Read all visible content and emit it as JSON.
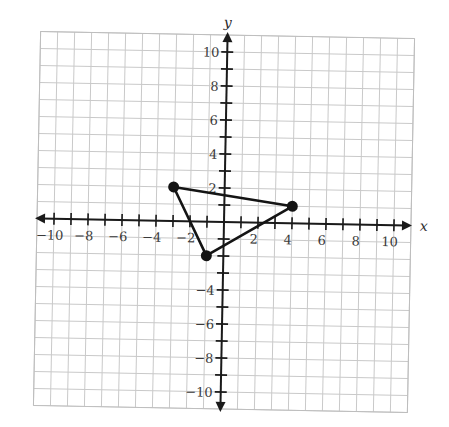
{
  "chart_data": {
    "type": "scatter",
    "title": "",
    "xlabel": "x",
    "ylabel": "y",
    "xlim": [
      -11,
      11
    ],
    "ylim": [
      -11,
      11
    ],
    "grid": true,
    "x_ticks": [
      -10,
      -8,
      -6,
      -4,
      -2,
      2,
      4,
      6,
      8,
      10
    ],
    "y_ticks": [
      -10,
      -8,
      -6,
      -4,
      2,
      4,
      6,
      8,
      10
    ],
    "x_tick_labels": [
      "−10",
      "−8",
      "−6",
      "−4",
      "−2",
      "2",
      "4",
      "6",
      "8",
      "10"
    ],
    "y_tick_labels": [
      "−10",
      "−8",
      "−6",
      "−4",
      "2",
      "4",
      "6",
      "8",
      "10"
    ],
    "series": [
      {
        "name": "triangle",
        "shape": "polygon",
        "points": [
          {
            "x": -3,
            "y": 2
          },
          {
            "x": 4,
            "y": 1
          },
          {
            "x": -1,
            "y": -2
          }
        ]
      }
    ]
  },
  "plane": {
    "origin_px": [
      224,
      222
    ],
    "unit_px": 17,
    "rotation_deg": 1.1,
    "colors": {
      "grid": "#c9c9c9",
      "axis": "#1a1a1a",
      "shape": "#141414",
      "background": "#ffffff"
    }
  }
}
